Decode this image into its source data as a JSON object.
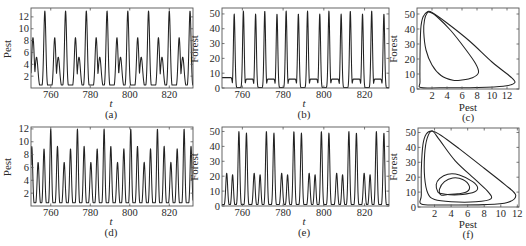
{
  "chart_data": [
    {
      "id": "a",
      "type": "line",
      "panel_label": "(a)",
      "xlabel": "t",
      "ylabel": "Pest",
      "xlim": [
        750,
        832
      ],
      "ylim": [
        0,
        13.5
      ],
      "xticks": [
        760,
        780,
        800,
        820
      ],
      "yticks": [
        2,
        4,
        6,
        8,
        10,
        12
      ],
      "series": [
        {
          "name": "Pest",
          "pattern": "period 10.5: major peak ~13, minor peak ~8.5 with shoulder ~5.5, troughs ~0.5",
          "peaks": [
            [
              751,
              8.5,
              0.9
            ],
            [
              757,
              13,
              0.75
            ],
            [
              762,
              8.5,
              0.8
            ],
            [
              767.5,
              13,
              0.75
            ],
            [
              772.5,
              8.5,
              0.8
            ],
            [
              778,
              13,
              0.75
            ],
            [
              783,
              8.5,
              0.8
            ],
            [
              788.5,
              13,
              0.75
            ],
            [
              793.5,
              8.5,
              0.8
            ],
            [
              799,
              13,
              0.75
            ],
            [
              804,
              8.5,
              0.8
            ],
            [
              809.5,
              13,
              0.75
            ],
            [
              814.5,
              8.5,
              0.8
            ],
            [
              820,
              13,
              0.75
            ],
            [
              825,
              8.5,
              0.8
            ],
            [
              830.5,
              13,
              0.75
            ]
          ],
          "shoulders": [
            [
              752.8,
              5.2,
              1.0
            ],
            [
              763.8,
              5.2,
              1.0
            ],
            [
              774.3,
              5.2,
              1.0
            ],
            [
              784.8,
              5.2,
              1.0
            ],
            [
              795.3,
              5.2,
              1.0
            ],
            [
              805.8,
              5.2,
              1.0
            ],
            [
              816.3,
              5.2,
              1.0
            ],
            [
              826.8,
              5.2,
              1.0
            ]
          ],
          "baseline": 0.5
        }
      ]
    },
    {
      "id": "b",
      "type": "line",
      "panel_label": "(b)",
      "xlabel": "t",
      "ylabel": "Forest",
      "xlim": [
        750,
        832
      ],
      "ylim": [
        0,
        54
      ],
      "xticks": [
        760,
        780,
        800,
        820
      ],
      "yticks": [
        0,
        10,
        20,
        30,
        40,
        50
      ],
      "series": [
        {
          "name": "Forest",
          "pattern": "paired peaks ~50 every ~5.25, plateau ~7 between pairs, troughs ~0",
          "peaks": [
            [
              756,
              50,
              0.55
            ],
            [
              760.5,
              52,
              0.55
            ],
            [
              766.5,
              50,
              0.55
            ],
            [
              771,
              52,
              0.55
            ],
            [
              777,
              50,
              0.55
            ],
            [
              781.5,
              52,
              0.55
            ],
            [
              787.5,
              50,
              0.55
            ],
            [
              792,
              52,
              0.55
            ],
            [
              798,
              50,
              0.55
            ],
            [
              802.5,
              52,
              0.55
            ],
            [
              808.5,
              50,
              0.55
            ],
            [
              813,
              52,
              0.55
            ],
            [
              819,
              50,
              0.55
            ],
            [
              823.5,
              52,
              0.55
            ],
            [
              829.5,
              50,
              0.55
            ]
          ],
          "plateaus": [
            [
              750,
              754.5,
              7
            ],
            [
              762,
              765,
              6
            ],
            [
              772.5,
              775.5,
              6
            ],
            [
              783,
              786,
              6
            ],
            [
              793.5,
              796.5,
              6
            ],
            [
              804,
              807,
              6
            ],
            [
              814.5,
              817.5,
              6
            ],
            [
              825,
              828,
              6
            ]
          ],
          "baseline": 0.3
        }
      ]
    },
    {
      "id": "c",
      "type": "scatter",
      "panel_label": "(c)",
      "xlabel": "Pest",
      "ylabel": "Forest",
      "xlim": [
        0,
        13.6
      ],
      "ylim": [
        0,
        54
      ],
      "xticks": [
        2,
        4,
        6,
        8,
        10,
        12
      ],
      "yticks": [
        0,
        10,
        20,
        30,
        40,
        50
      ],
      "series": [
        {
          "name": "outer loop",
          "points": [
            [
              0.5,
              1
            ],
            [
              3,
              0.8
            ],
            [
              8,
              1
            ],
            [
              11.5,
              1.8
            ],
            [
              13,
              4
            ],
            [
              12.5,
              8
            ],
            [
              10,
              18
            ],
            [
              7,
              32
            ],
            [
              4,
              44
            ],
            [
              2,
              51
            ],
            [
              1.4,
              51.5
            ],
            [
              0.8,
              48
            ],
            [
              0.5,
              40
            ],
            [
              0.4,
              20
            ],
            [
              0.4,
              5
            ],
            [
              0.5,
              1
            ]
          ]
        },
        {
          "name": "inner loop",
          "points": [
            [
              1.4,
              51
            ],
            [
              1,
              46
            ],
            [
              0.9,
              38
            ],
            [
              1.2,
              26
            ],
            [
              2,
              16
            ],
            [
              3.2,
              9
            ],
            [
              4.8,
              5.8
            ],
            [
              6,
              6
            ],
            [
              7.4,
              7.5
            ],
            [
              8.2,
              11
            ],
            [
              7.8,
              17
            ],
            [
              6.4,
              27
            ],
            [
              4.5,
              39
            ],
            [
              2.6,
              48.5
            ],
            [
              1.8,
              51
            ],
            [
              1.4,
              51
            ]
          ]
        }
      ]
    },
    {
      "id": "d",
      "type": "line",
      "panel_label": "(d)",
      "xlabel": "t",
      "ylabel": "Pest",
      "xlim": [
        750,
        832
      ],
      "ylim": [
        0,
        12.3
      ],
      "xticks": [
        760,
        780,
        800,
        820
      ],
      "yticks": [
        2,
        4,
        6,
        8,
        10,
        12
      ],
      "series": [
        {
          "name": "Pest",
          "pattern": "period ~13.5: peaks 9.3, 6.8, 8.9, 12 with troughs ~2.5 and ~0.5",
          "peaks": [
            [
              750.4,
              9.3,
              0.65
            ],
            [
              753.6,
              6.8,
              0.7
            ],
            [
              756.6,
              8.9,
              0.65
            ],
            [
              760,
              12,
              0.6
            ],
            [
              763.4,
              9.3,
              0.65
            ],
            [
              766.8,
              6.8,
              0.7
            ],
            [
              770,
              8.9,
              0.65
            ],
            [
              773.5,
              12,
              0.6
            ],
            [
              776.9,
              9.3,
              0.65
            ],
            [
              780.3,
              6.8,
              0.7
            ],
            [
              783.5,
              8.9,
              0.65
            ],
            [
              787,
              12,
              0.6
            ],
            [
              790.4,
              9.3,
              0.65
            ],
            [
              793.8,
              6.8,
              0.7
            ],
            [
              797,
              8.9,
              0.65
            ],
            [
              800.5,
              12,
              0.6
            ],
            [
              803.9,
              9.3,
              0.65
            ],
            [
              807.3,
              6.8,
              0.7
            ],
            [
              810.5,
              8.9,
              0.65
            ],
            [
              814,
              12,
              0.6
            ],
            [
              817.4,
              9.3,
              0.65
            ],
            [
              820.8,
              6.8,
              0.7
            ],
            [
              824,
              8.9,
              0.65
            ],
            [
              827.5,
              12,
              0.6
            ],
            [
              831,
              9.3,
              0.65
            ]
          ],
          "baseline": 0.5
        }
      ]
    },
    {
      "id": "e",
      "type": "line",
      "panel_label": "(e)",
      "xlabel": "t",
      "ylabel": "Forest",
      "xlim": [
        750,
        832
      ],
      "ylim": [
        0,
        53
      ],
      "xticks": [
        760,
        780,
        800,
        820
      ],
      "yticks": [
        0,
        10,
        20,
        30,
        40,
        50
      ],
      "series": [
        {
          "name": "Forest",
          "pattern": "period ~13.5: small peaks ~22, ~21, then tall pair ~50, ~49",
          "peaks": [
            [
              752.3,
              22,
              0.65
            ],
            [
              755.2,
              21,
              0.6
            ],
            [
              758.3,
              50,
              0.6
            ],
            [
              762,
              49,
              0.6
            ],
            [
              765.8,
              22,
              0.65
            ],
            [
              768.7,
              21,
              0.6
            ],
            [
              771.8,
              50,
              0.6
            ],
            [
              775.5,
              49,
              0.6
            ],
            [
              779.3,
              22,
              0.65
            ],
            [
              782.2,
              21,
              0.6
            ],
            [
              785.3,
              50,
              0.6
            ],
            [
              789,
              49,
              0.6
            ],
            [
              792.8,
              22,
              0.65
            ],
            [
              795.7,
              21,
              0.6
            ],
            [
              798.8,
              50,
              0.6
            ],
            [
              802.5,
              49,
              0.6
            ],
            [
              806.3,
              22,
              0.65
            ],
            [
              809.2,
              21,
              0.6
            ],
            [
              812.3,
              50,
              0.6
            ],
            [
              816,
              49,
              0.6
            ],
            [
              819.8,
              22,
              0.65
            ],
            [
              822.7,
              21,
              0.6
            ],
            [
              825.8,
              50,
              0.6
            ],
            [
              829.5,
              49,
              0.6
            ]
          ],
          "baseline": 1
        }
      ]
    },
    {
      "id": "f",
      "type": "scatter",
      "panel_label": "(f)",
      "xlabel": "Pest",
      "ylabel": "Forest",
      "xlim": [
        0,
        12.2
      ],
      "ylim": [
        0,
        53
      ],
      "xticks": [
        2,
        4,
        6,
        8,
        10,
        12
      ],
      "yticks": [
        0,
        10,
        20,
        30,
        40,
        50
      ],
      "series": [
        {
          "name": "outer loop",
          "points": [
            [
              0.4,
              2
            ],
            [
              3,
              1.4
            ],
            [
              8,
              1.6
            ],
            [
              10.8,
              3
            ],
            [
              11.8,
              8
            ],
            [
              10.5,
              15
            ],
            [
              8,
              26
            ],
            [
              5,
              39
            ],
            [
              2.8,
              48
            ],
            [
              1.7,
              51
            ],
            [
              1,
              49
            ],
            [
              0.6,
              42
            ],
            [
              0.4,
              25
            ],
            [
              0.4,
              8
            ],
            [
              0.4,
              2
            ]
          ]
        },
        {
          "name": "middle loop",
          "points": [
            [
              1.7,
              51
            ],
            [
              1.1,
              46
            ],
            [
              0.8,
              35
            ],
            [
              0.8,
              20
            ],
            [
              1.2,
              9
            ],
            [
              2,
              5
            ],
            [
              4,
              3.5
            ],
            [
              7,
              3.5
            ],
            [
              8.8,
              5.5
            ],
            [
              8.5,
              10
            ],
            [
              7,
              18
            ],
            [
              4.5,
              31
            ],
            [
              2.6,
              45
            ],
            [
              1.7,
              51
            ]
          ]
        },
        {
          "name": "inner loop",
          "points": [
            [
              2.4,
              10
            ],
            [
              2.2,
              15
            ],
            [
              2.6,
              19
            ],
            [
              3.6,
              22
            ],
            [
              5,
              21.5
            ],
            [
              6.6,
              17
            ],
            [
              7.2,
              13
            ],
            [
              6.8,
              10
            ],
            [
              5.4,
              8.4
            ],
            [
              3.8,
              8.2
            ],
            [
              2.8,
              9
            ],
            [
              2.4,
              10
            ]
          ]
        },
        {
          "name": "innermost loop",
          "points": [
            [
              2.8,
              8
            ],
            [
              2.6,
              12
            ],
            [
              3.2,
              17
            ],
            [
              4.2,
              19.5
            ],
            [
              5.4,
              18.5
            ],
            [
              6.2,
              14
            ],
            [
              5.9,
              10.2
            ],
            [
              4.8,
              8.8
            ],
            [
              3.6,
              8.4
            ],
            [
              2.8,
              8
            ]
          ]
        }
      ]
    }
  ],
  "panels": {
    "a": {
      "label": "(a)",
      "xlabel": "t",
      "ylabel": "Pest"
    },
    "b": {
      "label": "(b)",
      "xlabel": "t",
      "ylabel": "Forest"
    },
    "c": {
      "label": "(c)",
      "xlabel": "Pest",
      "ylabel": "Forest"
    },
    "d": {
      "label": "(d)",
      "xlabel": "t",
      "ylabel": "Pest"
    },
    "e": {
      "label": "(e)",
      "xlabel": "t",
      "ylabel": "Forest"
    },
    "f": {
      "label": "(f)",
      "xlabel": "Pest",
      "ylabel": "Forest"
    }
  }
}
